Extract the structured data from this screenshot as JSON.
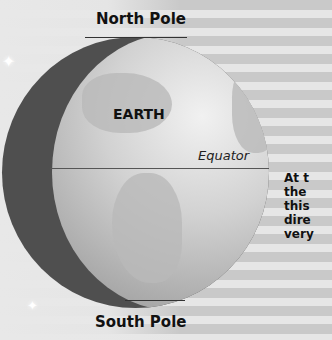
{
  "diagram": {
    "title": "EARTH",
    "labels": {
      "north_pole": "North Pole",
      "south_pole": "South Pole",
      "equator": "Equator"
    },
    "side_text_lines": [
      "At t",
      "the ",
      "this",
      "dire",
      "very"
    ]
  },
  "colors": {
    "stripe_dark": "#c9c9c9",
    "stripe_light": "#e6e6e6",
    "globe_shadow": "#4f4f4f",
    "globe_lit": "#d2d2d2"
  }
}
